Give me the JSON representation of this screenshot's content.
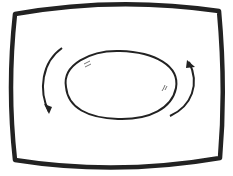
{
  "illustration": {
    "description": "Rotation symbol inside a rounded screen frame",
    "stroke_color": "#222222",
    "background_color": "#ffffff"
  }
}
